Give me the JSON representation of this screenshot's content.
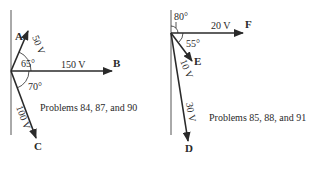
{
  "diagrams": [
    {
      "caption": "Problems 84, 87, and 90",
      "vectors": [
        {
          "name": "A",
          "magnitude": "50 V"
        },
        {
          "name": "B",
          "magnitude": "150 V"
        },
        {
          "name": "C",
          "magnitude": "100 V"
        }
      ],
      "angles": [
        "65°",
        "70°"
      ]
    },
    {
      "caption": "Problems 85, 88, and 91",
      "vectors": [
        {
          "name": "F",
          "magnitude": "20 V"
        },
        {
          "name": "E",
          "magnitude": "10 V"
        },
        {
          "name": "D",
          "magnitude": "30 V"
        }
      ],
      "angles": [
        "80°",
        "55°"
      ]
    }
  ],
  "colors": {
    "ink": "#2a2a2a",
    "background": "#ffffff"
  }
}
